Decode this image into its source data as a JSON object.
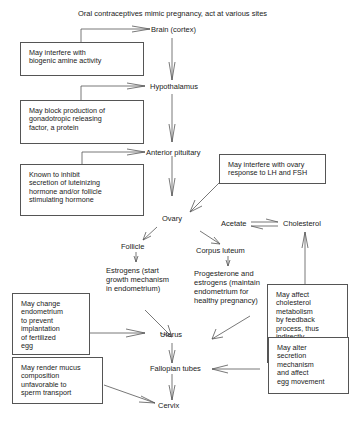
{
  "title": "Oral contraceptives mimic pregnancy, act at various sites",
  "nodes": {
    "brain": "Brain (cortex)",
    "hypothalamus": "Hypothalamus",
    "anterior_pituitary": "Anterior pituitary",
    "ovary": "Ovary",
    "follicle": "Follicle",
    "corpus_luteum": "Corpus luteum",
    "acetate": "Acetate",
    "cholesterol": "Cholesterol",
    "estrogens": "Estrogens (start\ngrowth mechanism\nin endometrium)",
    "progesterone": "Progesterone and\nestrogens (maintain\nendometrium for\nhealthy pregnancy)",
    "uterus": "Uterus",
    "fallopian": "Fallopian tubes",
    "cervix": "Cervix"
  },
  "boxes": {
    "biogenic": "May interfere with\nbiogenic amine activity",
    "gnrf": "May block production of\ngonadotropic releasing\nfactor, a protein",
    "lh_fsh": "Known to inhibit\nsecretion of luteinizing\nhormone and/or follicle\nstimulating hormone",
    "ovary_response": "May interfere with ovary\nresponse to LH and FSH",
    "cholesterol_metab": "May affect\ncholesterol\nmetabolism\nby feedback\nprocess, thus\nindirectly\naffect steroid\nsynthesis",
    "endometrium": "May change\nendometrium\nto prevent\nimplantation\nof fertilized\negg",
    "secretion": "May alter\nsecretion\nmechanism\nand affect\negg movement",
    "mucus": "May render mucus\ncomposition\nunfavorable to\nsperm transport"
  }
}
